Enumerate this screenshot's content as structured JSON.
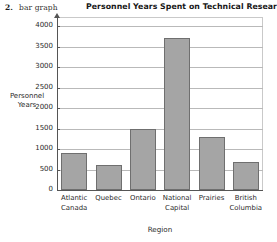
{
  "question": {
    "number": "2.",
    "label": "bar graph"
  },
  "chart_data": {
    "type": "bar",
    "title": "Personnel Years Spent on Technical Research",
    "xlabel": "Region",
    "ylabel": "Personnel\nYears",
    "ylabel_lines": [
      "Personnel",
      "Years"
    ],
    "categories": [
      "Atlantic\nCanada",
      "Quebec",
      "Ontario",
      "National\nCapital",
      "Prairies",
      "British\nColumbia"
    ],
    "values": [
      900,
      620,
      1500,
      3700,
      1300,
      680
    ],
    "ylim": [
      0,
      4000
    ],
    "ytick_step": 500,
    "yticks": [
      0,
      500,
      1000,
      1500,
      2000,
      2500,
      3000,
      3500,
      4000
    ],
    "ytick_labels": [
      "0",
      "500",
      "1000",
      "1500",
      "2000",
      "2500",
      "3000",
      "3500",
      "4000"
    ],
    "grid": true,
    "legend": false,
    "bar_color": "#a5a5a5",
    "bar_border_color": "#6f6f6f",
    "grid_color": "#b9b9b9",
    "axis_color": "#555555",
    "background": "#ffffff"
  }
}
